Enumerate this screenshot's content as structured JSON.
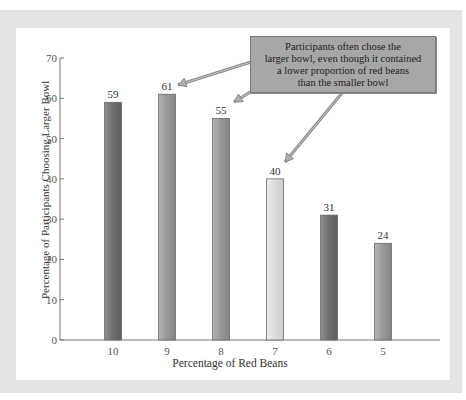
{
  "chart_data": {
    "type": "bar",
    "title": "",
    "xlabel": "Percentage of Red Beans",
    "ylabel": "Percentage of Participants Choosing Larger Bowl",
    "categories": [
      "10",
      "9",
      "8",
      "7",
      "6",
      "5"
    ],
    "values": [
      59,
      61,
      55,
      40,
      31,
      24
    ],
    "value_labels": [
      "59",
      "61",
      "55",
      "40",
      "31",
      "24"
    ],
    "ylim": [
      0,
      70
    ],
    "yticks": [
      "0",
      "10",
      "20",
      "30",
      "40",
      "50",
      "60",
      "70"
    ],
    "grid": false,
    "legend": null,
    "bar_colors": [
      "#7d7d7d",
      "#9a9a9a",
      "#9a9a9a",
      "#dcdcdc",
      "#7d7d7d",
      "#a4a4a4"
    ],
    "annotation": {
      "lines": [
        "Participants often chose the",
        "larger bowl, even though it contained",
        "a lower proportion of red beans",
        "than the smaller bowl"
      ],
      "points_to": [
        "9",
        "8",
        "7"
      ]
    }
  }
}
